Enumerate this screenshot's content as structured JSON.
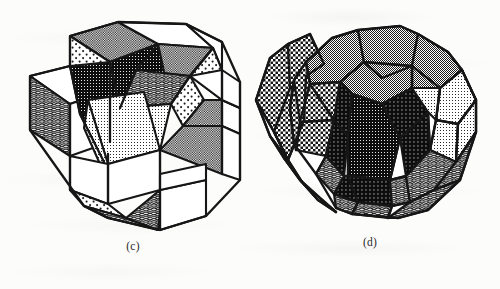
{
  "page": {
    "background_color": "#fcfcfb",
    "ink_color": "#141414",
    "width": 500,
    "height": 289,
    "kind": "scanned-book-figure"
  },
  "figures": [
    {
      "id": "c",
      "caption": "(c)",
      "name": "rhombic-zonohedron-exploded",
      "description": "Exploded rhombic zonohedron built from rhombohedral cells",
      "caption_position": {
        "x": 103,
        "y": 243,
        "width": 60
      },
      "bounds": {
        "x": 18,
        "y": 8,
        "width": 230,
        "height": 228
      }
    },
    {
      "id": "d",
      "caption": "(d)",
      "name": "rhombic-triacontahedron",
      "description": "Rhombic triacontahedron zonohedron with slab separated at left",
      "caption_position": {
        "x": 340,
        "y": 238,
        "width": 60
      },
      "bounds": {
        "x": 250,
        "y": 8,
        "width": 232,
        "height": 224
      }
    }
  ],
  "shading": {
    "tones": [
      {
        "name": "white-face",
        "label": "white",
        "hex": "#ffffff",
        "pattern": "solid"
      },
      {
        "name": "sparse-dot-face",
        "label": "sparse dots",
        "hex": "#f2f2f2",
        "pattern": "dot-sparse"
      },
      {
        "name": "light-gray-face",
        "label": "light gray halftone",
        "hex": "#d8d8d8",
        "pattern": "dither-light"
      },
      {
        "name": "mid-gray-face",
        "label": "mid gray halftone",
        "hex": "#9a9a9a",
        "pattern": "dither-mid"
      },
      {
        "name": "checker-face",
        "label": "checkerboard halftone",
        "hex": "#808080",
        "pattern": "checker"
      },
      {
        "name": "wavy-hatch-face",
        "label": "wavy hatch",
        "hex": "#707070",
        "pattern": "wave"
      },
      {
        "name": "dark-gray-face",
        "label": "dark gray halftone",
        "hex": "#4a4a4a",
        "pattern": "dither-dark"
      }
    ],
    "edge_color": "#141414",
    "edge_width": "2.2"
  }
}
